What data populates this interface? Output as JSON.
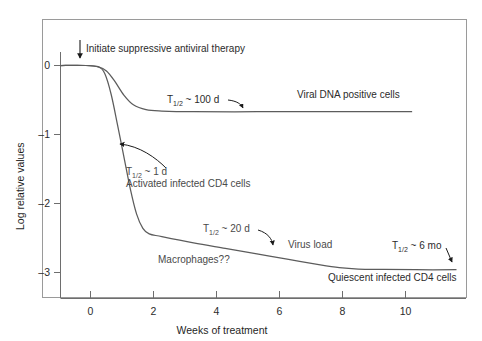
{
  "figure": {
    "background_color": "#ffffff",
    "frame_color": "#8a8a8a",
    "axis_color": "#6b6b6b",
    "curve_color": "#5c5c5c",
    "text_color": "#4a4a4a"
  },
  "chart_data": {
    "type": "line",
    "title": "",
    "xlabel": "Weeks of treatment",
    "ylabel": "Log relative values",
    "xlim": [
      -1.2,
      11.6
    ],
    "ylim": [
      -3.4,
      0.35
    ],
    "xticks": [
      0,
      2,
      4,
      6,
      8,
      10
    ],
    "xtick_labels": [
      "0",
      "2",
      "4",
      "6",
      "8",
      "10"
    ],
    "yticks": [
      0,
      -1,
      -2,
      -3
    ],
    "ytick_labels": [
      "0",
      "–1",
      "–2",
      "–3"
    ],
    "grid": false,
    "legend": "none",
    "series": [
      {
        "name": "Viral DNA positive cells",
        "half_life": "T1/2 ~ 100 d",
        "x": [
          -1.2,
          -0.4,
          0.0,
          0.25,
          0.5,
          0.8,
          1.1,
          1.5,
          2.0,
          3.0,
          5.0,
          7.0,
          9.0,
          9.9
        ],
        "y": [
          0.0,
          0.0,
          -0.02,
          -0.08,
          -0.22,
          -0.43,
          -0.57,
          -0.64,
          -0.66,
          -0.67,
          -0.67,
          -0.67,
          -0.67,
          -0.67
        ]
      },
      {
        "name": "Activated infected CD4 cells / Virus load / Quiescent infected CD4 cells",
        "half_life_decay": "T1/2 ~ 1 d",
        "half_life_mid": "T1/2 ~ 20 d",
        "half_life_late": "T1/2 ~ 6 mo",
        "x": [
          -1.2,
          -0.4,
          0.0,
          0.2,
          0.4,
          0.6,
          0.8,
          1.0,
          1.2,
          1.4,
          1.6,
          2.0,
          3.0,
          4.0,
          5.0,
          6.0,
          7.0,
          7.6,
          8.2,
          9.0,
          10.0,
          11.3
        ],
        "y": [
          0.0,
          0.0,
          -0.02,
          -0.12,
          -0.42,
          -0.86,
          -1.32,
          -1.78,
          -2.15,
          -2.36,
          -2.44,
          -2.48,
          -2.57,
          -2.65,
          -2.73,
          -2.81,
          -2.89,
          -2.93,
          -2.95,
          -2.955,
          -2.96,
          -2.96
        ]
      }
    ],
    "annotations": [
      {
        "name": "initiate-therapy",
        "text": "Initiate suppressive antiviral therapy",
        "arrow": "down",
        "x_px": 80,
        "y_px": 44
      },
      {
        "name": "half-life-100d",
        "text": "T",
        "sub": "1/2",
        "rest": " ~ 100 d",
        "arrow": "curved-down-right"
      },
      {
        "name": "viral-dna-positive-cells",
        "text": "Viral DNA positive cells",
        "arrow": "none"
      },
      {
        "name": "half-life-1d",
        "text": "T",
        "sub": "1/2",
        "rest": " ~ 1 d",
        "arrow": "curved-up-left"
      },
      {
        "name": "activated-infected-cd4",
        "text": "Activated infected CD4 cells",
        "arrow": "none"
      },
      {
        "name": "half-life-20d",
        "text": "T",
        "sub": "1/2",
        "rest": " ~ 20 d",
        "arrow": "curved-down-right"
      },
      {
        "name": "virus-load",
        "text": "Virus load",
        "arrow": "none"
      },
      {
        "name": "macrophages",
        "text": "Macrophages??",
        "arrow": "none"
      },
      {
        "name": "half-life-6mo",
        "text": "T",
        "sub": "1/2",
        "rest": " ~ 6 mo",
        "arrow": "short-down-right"
      },
      {
        "name": "quiescent-infected-cd4",
        "text": "Quiescent infected CD4 cells",
        "arrow": "none"
      }
    ]
  },
  "labels": {
    "initiate_therapy": "Initiate suppressive antiviral therapy",
    "viral_dna_positive_cells": "Viral DNA positive cells",
    "activated_infected_cd4_cells": "Activated infected CD4 cells",
    "virus_load": "Virus load",
    "macrophages": "Macrophages??",
    "quiescent_infected_cd4_cells": "Quiescent infected CD4 cells",
    "t_symbol": "T",
    "t_subscript": "1/2",
    "half_life_100d": " ~ 100 d",
    "half_life_1d": " ~ 1 d",
    "half_life_20d": " ~ 20 d",
    "half_life_6mo": " ~ 6 mo",
    "x_axis_title": "Weeks of treatment",
    "y_axis_title": "Log relative values",
    "xtick_0": "0",
    "xtick_2": "2",
    "xtick_4": "4",
    "xtick_6": "6",
    "xtick_8": "8",
    "xtick_10": "10",
    "ytick_0": "0",
    "ytick_m1": "–1",
    "ytick_m2": "–2",
    "ytick_m3": "–3"
  }
}
